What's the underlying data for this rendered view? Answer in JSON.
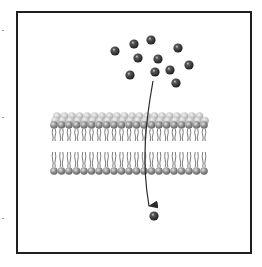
{
  "figure": {
    "caption": "",
    "frame": {
      "x": 16,
      "y": 11,
      "width": 236,
      "height": 243,
      "stroke": "#1f1f1f"
    },
    "colors": {
      "molecule": "#2e2e2e",
      "molecule_highlight": "#d8d8d8",
      "head_front": "#8f8f8f",
      "head_back": "#c4c4c4",
      "tail": "#5a5a5a",
      "arrow": "#2a2a2a"
    },
    "molecules_outside": [
      {
        "x": 115,
        "y": 51
      },
      {
        "x": 134,
        "y": 44
      },
      {
        "x": 151,
        "y": 40
      },
      {
        "x": 178,
        "y": 48
      },
      {
        "x": 138,
        "y": 58
      },
      {
        "x": 158,
        "y": 59
      },
      {
        "x": 189,
        "y": 65
      },
      {
        "x": 130,
        "y": 75
      },
      {
        "x": 155,
        "y": 72
      },
      {
        "x": 170,
        "y": 70
      },
      {
        "x": 176,
        "y": 83
      }
    ],
    "molecule_inside": {
      "x": 154,
      "y": 216
    },
    "molecule_radius": 4.6,
    "membrane": {
      "x_start": 54,
      "x_end": 205,
      "head_spacing": 7.5,
      "head_radius": 3.8,
      "top_back_y": 116,
      "top_front_y": 125,
      "upper_tail_top": 129,
      "upper_tail_bottom": 141,
      "lower_tail_top": 152,
      "lower_tail_bottom": 167,
      "bottom_y": 171
    },
    "arrow": {
      "path": "M153 81 C 146 120, 141 160, 149 206"
    },
    "edge_marks": [
      {
        "x": 2,
        "y": 30
      },
      {
        "x": 2,
        "y": 117
      },
      {
        "x": 2,
        "y": 218
      }
    ]
  }
}
